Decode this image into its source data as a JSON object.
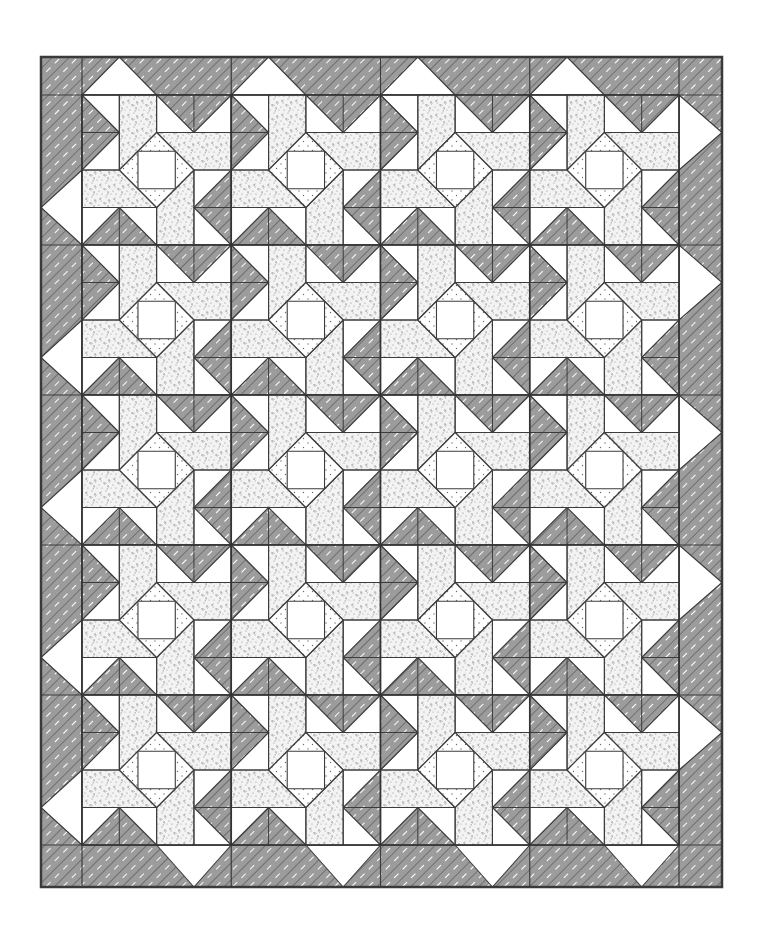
{
  "illustration": {
    "title": "Pinwheel star quilt with square-in-a-square centers",
    "canvas": {
      "width": 762,
      "height": 939,
      "background": "#ffffff"
    },
    "frame": {
      "x": 41,
      "y": 57,
      "width": 681,
      "height": 830,
      "stroke": "#3a3a3a",
      "stroke_width": 2.5
    },
    "inner_area": {
      "x": 82,
      "y": 95,
      "width": 597,
      "height": 750
    },
    "grid": {
      "columns": 4,
      "rows": 5,
      "block_width": 149.25,
      "block_height": 150,
      "units_per_block": 4
    },
    "colors": {
      "line": "#3c3c3c",
      "herringbone_bg": "#ffffff",
      "herringbone_stroke": "#4a4a4a",
      "floral_bg": "#f2f2f2",
      "floral_speck": "#8a8a8a",
      "dotted_bg": "#ffffff",
      "dotted_speck": "#6a6a6a",
      "plain": "#ffffff"
    },
    "block_shapes": {
      "herringbone": [
        [
          [
            0,
            0
          ],
          [
            1,
            1
          ],
          [
            0,
            2
          ]
        ],
        [
          [
            2,
            0
          ],
          [
            4,
            0
          ],
          [
            3,
            1
          ]
        ],
        [
          [
            4,
            2
          ],
          [
            4,
            4
          ],
          [
            3,
            3
          ]
        ],
        [
          [
            0,
            4
          ],
          [
            2,
            4
          ],
          [
            1,
            3
          ]
        ]
      ],
      "floral": [
        [
          [
            1,
            0
          ],
          [
            2,
            0
          ],
          [
            2,
            1
          ],
          [
            1,
            2
          ]
        ],
        [
          [
            2,
            1
          ],
          [
            4,
            1
          ],
          [
            4,
            2
          ],
          [
            3,
            2
          ]
        ],
        [
          [
            3,
            2
          ],
          [
            3,
            4
          ],
          [
            2,
            4
          ],
          [
            2,
            3
          ]
        ],
        [
          [
            0,
            2
          ],
          [
            1,
            2
          ],
          [
            2,
            3
          ],
          [
            0,
            3
          ]
        ]
      ],
      "dotted_diamond": [
        [
          2,
          1
        ],
        [
          3,
          2
        ],
        [
          2,
          3
        ],
        [
          1,
          2
        ]
      ],
      "center_square": [
        [
          1.5,
          1.5
        ],
        [
          2.5,
          1.5
        ],
        [
          2.5,
          2.5
        ],
        [
          1.5,
          2.5
        ]
      ],
      "seams": [
        [
          [
            1,
            0
          ],
          [
            1,
            2
          ]
        ],
        [
          [
            0,
            1
          ],
          [
            1,
            1
          ]
        ],
        [
          [
            0,
            2
          ],
          [
            1,
            2
          ]
        ],
        [
          [
            1,
            1
          ],
          [
            0,
            0
          ]
        ],
        [
          [
            1,
            1
          ],
          [
            0,
            2
          ]
        ],
        [
          [
            2,
            0
          ],
          [
            2,
            1
          ]
        ],
        [
          [
            2,
            1
          ],
          [
            4,
            1
          ]
        ],
        [
          [
            3,
            1
          ],
          [
            3,
            0
          ]
        ],
        [
          [
            3,
            2
          ],
          [
            4,
            2
          ]
        ],
        [
          [
            3,
            2
          ],
          [
            3,
            4
          ]
        ],
        [
          [
            3,
            3
          ],
          [
            4,
            3
          ]
        ],
        [
          [
            0,
            3
          ],
          [
            2,
            3
          ]
        ],
        [
          [
            1,
            3
          ],
          [
            1,
            4
          ]
        ],
        [
          [
            2,
            3
          ],
          [
            2,
            4
          ]
        ]
      ]
    },
    "border": {
      "top_triangle": {
        "span_units": [
          0,
          2
        ],
        "apex_unit": 1,
        "direction": "up"
      },
      "left_triangle": {
        "span_units": [
          2,
          4
        ],
        "apex_unit": 3,
        "direction": "left"
      },
      "right_triangle": {
        "span_units": [
          0,
          2
        ],
        "apex_unit": 1,
        "direction": "right"
      },
      "bottom_triangle": {
        "span_units": [
          2,
          4
        ],
        "apex_unit": 3,
        "direction": "down"
      }
    }
  }
}
